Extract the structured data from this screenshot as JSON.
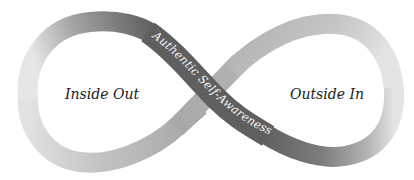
{
  "diagram": {
    "type": "infinity-loop",
    "left_loop": {
      "label": "Inside Out"
    },
    "right_loop": {
      "label": "Outside In"
    },
    "crossing_band": {
      "label": "Authentic Self-Awareness"
    },
    "colors": {
      "background": "#ffffff",
      "dark_band": "#5f5f5f",
      "light_band_mid": "#a9a9a9",
      "light_band_edge": "#dedede",
      "band_text": "#f4f4f4",
      "loop_label": "#1a1a1a"
    }
  }
}
